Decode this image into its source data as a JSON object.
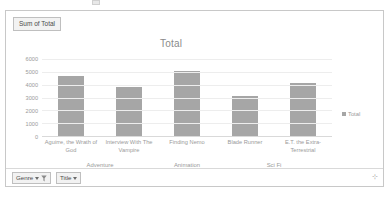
{
  "window": {
    "field_button_label": "Sum of Total"
  },
  "legend": {
    "entries": [
      {
        "label": "Total",
        "color": "#a6a6a6"
      }
    ]
  },
  "filter_bar": {
    "genre_button": "Genre",
    "title_button": "Title",
    "genre_filter_active": true,
    "resize_grip": "⊹"
  },
  "chart_data": {
    "type": "bar",
    "title": "Total",
    "xlabel": "",
    "ylabel": "",
    "ylim": [
      0,
      6000
    ],
    "yticks": [
      6000,
      5000,
      4000,
      3000,
      2000,
      1000,
      0
    ],
    "grid": true,
    "legend_position": "right",
    "bar_color": "#a6a6a6",
    "categories": [
      "Aguirre, the Wrath of God",
      "Interview With The Vampire",
      "Finding Nemo",
      "Blade Runner",
      "E.T. the Extra-Terrestrial"
    ],
    "groups": [
      {
        "label": "Adventure",
        "span": 2
      },
      {
        "label": "Animation",
        "span": 1
      },
      {
        "label": "Sci Fi",
        "span": 2
      }
    ],
    "series": [
      {
        "name": "Total",
        "values": [
          4700,
          3850,
          5050,
          3100,
          4100
        ]
      }
    ]
  }
}
